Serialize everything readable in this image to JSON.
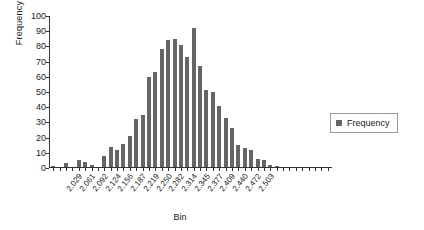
{
  "chart_data": {
    "type": "bar",
    "title": "",
    "xlabel": "Bin",
    "ylabel": "Frequency",
    "ylim": [
      0,
      100
    ],
    "yticks": [
      0,
      10,
      20,
      30,
      40,
      50,
      60,
      70,
      80,
      90,
      100
    ],
    "grid": false,
    "legend": {
      "position": "right",
      "entries": [
        "Frequency"
      ]
    },
    "series_name": "Frequency",
    "bar_color": "#666666",
    "categories": [
      "2.029",
      "2.045",
      "2.061",
      "2.077",
      "2.092",
      "2.108",
      "2.124",
      "2.140",
      "2.156",
      "2.171",
      "2.187",
      "2.203",
      "2.219",
      "2.235",
      "2.250",
      "2.266",
      "2.282",
      "2.298",
      "2.314",
      "2.330",
      "2.345",
      "2.361",
      "2.377",
      "2.393",
      "2.409",
      "2.424",
      "2.440",
      "2.456",
      "2.472",
      "2.488",
      "2.503",
      "2.519",
      "2.535",
      "2.550",
      "2.566",
      "2.582",
      "2.598",
      "2.613",
      "2.629",
      "2.645",
      "2.661",
      "2.677",
      "2.692",
      "2.708"
    ],
    "tick_labels": [
      "2.029",
      "2.061",
      "2.092",
      "2.124",
      "2.156",
      "2.187",
      "2.219",
      "2.250",
      "2.282",
      "2.314",
      "2.345",
      "2.377",
      "2.409",
      "2.440",
      "2.472",
      "2.503"
    ],
    "values": [
      1,
      0,
      3,
      0,
      5,
      4,
      2,
      0,
      8,
      14,
      12,
      16,
      21,
      32,
      35,
      60,
      63,
      78,
      84,
      85,
      81,
      73,
      92,
      67,
      51,
      50,
      41,
      33,
      26,
      15,
      13,
      12,
      6,
      5,
      2,
      1,
      0,
      0,
      0,
      0,
      0,
      0,
      0,
      0
    ]
  }
}
